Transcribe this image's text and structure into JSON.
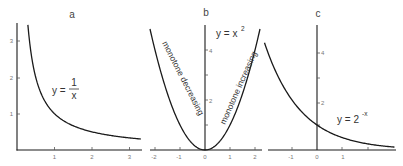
{
  "chart_data": [
    {
      "type": "line",
      "panel": "a",
      "title": "a",
      "function": "y = 1/x",
      "annotation": {
        "text": "y = ",
        "numerator": "1",
        "denominator": "x"
      },
      "xticks": [
        "1",
        "2",
        "3"
      ],
      "yticks": [
        "1",
        "2",
        "3"
      ],
      "xlim": [
        0,
        3.3
      ],
      "ylim": [
        0,
        3.5
      ],
      "series": [
        {
          "name": "y = 1/x",
          "x": [
            0.29,
            0.5,
            1,
            1.5,
            2,
            2.5,
            3,
            3.3
          ],
          "y": [
            3.45,
            2,
            1,
            0.667,
            0.5,
            0.4,
            0.333,
            0.303
          ]
        }
      ]
    },
    {
      "type": "line",
      "panel": "b",
      "title": "b",
      "function": "y = x^2",
      "annotation": {
        "text": "y = x",
        "sup": "2"
      },
      "region_labels": [
        "monotone decreasing",
        "monotone increasing"
      ],
      "xticks": [
        "-2",
        "-1",
        "0",
        "1",
        "2"
      ],
      "yticks": [
        "2",
        "4"
      ],
      "xlim": [
        -2.2,
        2.3
      ],
      "ylim": [
        0,
        5
      ],
      "series": [
        {
          "name": "y = x^2",
          "x": [
            -2.2,
            -2,
            -1,
            0,
            1,
            2,
            2.2
          ],
          "y": [
            4.84,
            4,
            1,
            0,
            1,
            4,
            4.84
          ]
        }
      ]
    },
    {
      "type": "line",
      "panel": "c",
      "title": "c",
      "function": "y = 2^-x",
      "annotation": {
        "text": "y = 2",
        "sup": "-x"
      },
      "xticks": [
        "-1",
        "0",
        "1"
      ],
      "yticks": [
        "2",
        "4"
      ],
      "xlim": [
        -2,
        3.1
      ],
      "ylim": [
        0,
        5
      ],
      "series": [
        {
          "name": "y = 2^-x",
          "x": [
            -2.1,
            -2,
            -1,
            0,
            1,
            2,
            3,
            3.1
          ],
          "y": [
            4.29,
            4,
            2,
            1,
            0.5,
            0.25,
            0.125,
            0.117
          ]
        }
      ]
    }
  ]
}
